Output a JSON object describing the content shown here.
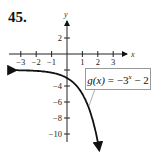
{
  "problem": {
    "number": "45."
  },
  "chart_data": {
    "type": "line",
    "title": "",
    "function_label": "g(x) = −3^x − 2",
    "function_label_parts": {
      "lhs": "g(x)",
      "eq": " = −3",
      "exp": "x",
      "rest": " − 2"
    },
    "xlabel": "x",
    "ylabel": "y",
    "xlim": [
      -3.2,
      4
    ],
    "ylim": [
      -10.5,
      4
    ],
    "x_ticks": [
      -3,
      -2,
      -1,
      1,
      2,
      3
    ],
    "x_tick_labels": [
      "−3",
      "−2",
      "−1",
      "1",
      "2",
      "3"
    ],
    "y_ticks": [
      2,
      -2,
      -4,
      -6,
      -8,
      -10
    ],
    "y_tick_labels": [
      "2",
      "",
      "−4",
      "−6",
      "−8",
      "−10"
    ],
    "horizontal_asymptote": -2,
    "grid": false,
    "series": [
      {
        "name": "g(x) = −3^x − 2",
        "x": [
          -3.2,
          -3,
          -2,
          -1,
          0,
          0.5,
          1,
          1.5,
          2,
          2.1
        ],
        "values": [
          -2.03,
          -2.04,
          -2.11,
          -2.33,
          -3,
          -3.73,
          -5,
          -7.2,
          -11,
          -12.05
        ]
      }
    ],
    "arrows": {
      "left_end": true,
      "bottom_end": true
    }
  },
  "colors": {
    "axis": "#222222",
    "curve": "#111111",
    "box_border": "#999999",
    "background": "#ffffff"
  }
}
